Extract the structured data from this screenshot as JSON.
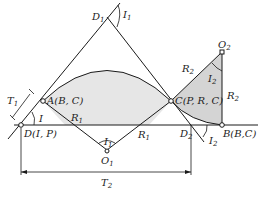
{
  "diagram": {
    "title": "",
    "colors": {
      "line": "#1a1a1a",
      "fill_curve1": "#e6e6e6",
      "fill_curve2": "#d4d4d4",
      "background": "#ffffff"
    },
    "points": {
      "D": {
        "name": "D",
        "params": "(I, P)"
      },
      "A": {
        "name": "A",
        "params": "(B, C)"
      },
      "C": {
        "name": "C",
        "params": "(P, R, C)"
      },
      "B": {
        "name": "B",
        "params": "(B,C)"
      },
      "D1": {
        "name": "D",
        "sub": "1"
      },
      "D2": {
        "name": "D",
        "sub": "2"
      },
      "O1": {
        "name": "O",
        "sub": "1"
      },
      "O2": {
        "name": "O",
        "sub": "2"
      }
    },
    "labels": {
      "I": "I",
      "I1": {
        "name": "I",
        "sub": "1"
      },
      "I1_center": {
        "name": "I",
        "sub": "1"
      },
      "I2_top": {
        "name": "I",
        "sub": "2"
      },
      "I2_bottom": {
        "name": "I",
        "sub": "2"
      },
      "R1_left_tangent": {
        "name": "R",
        "sub": "1"
      },
      "R1_left_radius": {
        "name": "R",
        "sub": "1"
      },
      "R1_right_radius": {
        "name": "R",
        "sub": "1"
      },
      "R2_top": {
        "name": "R",
        "sub": "2"
      },
      "R2_side": {
        "name": "R",
        "sub": "2"
      },
      "T1": {
        "name": "T",
        "sub": "1"
      },
      "T2": {
        "name": "T",
        "sub": "2"
      }
    }
  }
}
